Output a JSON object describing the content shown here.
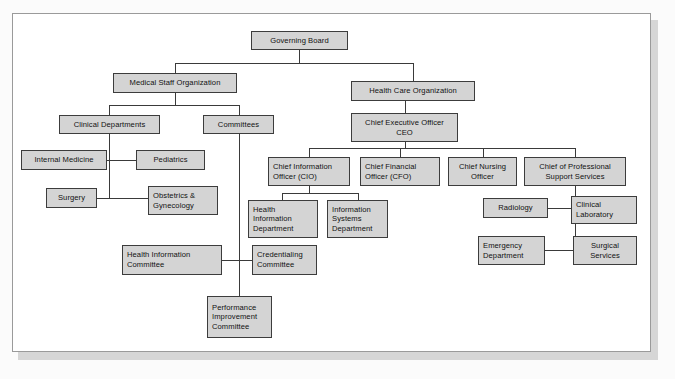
{
  "diagram": {
    "type": "org-chart",
    "colors": {
      "node_fill": "#d4d4d4",
      "node_border": "#3c3c3c",
      "line": "#3a3a3a",
      "panel_background": "#ffffff",
      "panel_border": "#9a9a9a",
      "page_background": "#fbfbfb",
      "shadow": "#d6d6d6"
    },
    "nodes": [
      {
        "id": "governing-board",
        "label": "Governing Board",
        "align": "center"
      },
      {
        "id": "medical-staff-organization",
        "label": "Medical Staff Organization",
        "align": "center"
      },
      {
        "id": "health-care-organization",
        "label": "Health Care Organization",
        "align": "center"
      },
      {
        "id": "clinical-departments",
        "label": "Clinical Departments",
        "align": "center"
      },
      {
        "id": "committees",
        "label": "Committees",
        "align": "center"
      },
      {
        "id": "chief-executive-officer",
        "label": "Chief Executive Officer\nCEO",
        "align": "center"
      },
      {
        "id": "internal-medicine",
        "label": "Internal Medicine",
        "align": "center"
      },
      {
        "id": "pediatrics",
        "label": "Pediatrics",
        "align": "center"
      },
      {
        "id": "surgery",
        "label": "Surgery",
        "align": "center"
      },
      {
        "id": "obstetrics-gynecology",
        "label": "Obstetrics &\nGynecology",
        "align": "left"
      },
      {
        "id": "chief-information-officer",
        "label": "Chief Information\nOfficer (CIO)",
        "align": "left"
      },
      {
        "id": "chief-financial-officer",
        "label": "Chief Financial\nOfficer (CFO)",
        "align": "left"
      },
      {
        "id": "chief-nursing-officer",
        "label": "Chief Nursing\nOfficer",
        "align": "center"
      },
      {
        "id": "chief-of-professional-support-services",
        "label": "Chief of Professional\nSupport Services",
        "align": "center"
      },
      {
        "id": "health-information-department",
        "label": "Health\nInformation\nDepartment",
        "align": "left"
      },
      {
        "id": "information-systems-department",
        "label": "Information\nSystems\nDepartment",
        "align": "left"
      },
      {
        "id": "radiology",
        "label": "Radiology",
        "align": "center"
      },
      {
        "id": "clinical-laboratory",
        "label": "Clinical\nLaboratory",
        "align": "left"
      },
      {
        "id": "emergency-department",
        "label": "Emergency\nDepartment",
        "align": "left"
      },
      {
        "id": "surgical-services",
        "label": "Surgical\nServices",
        "align": "center"
      },
      {
        "id": "health-information-committee",
        "label": "Health Information\nCommittee",
        "align": "left"
      },
      {
        "id": "credentialing-committee",
        "label": "Credentialing\nCommittee",
        "align": "left"
      },
      {
        "id": "performance-improvement-committee",
        "label": "Performance\nImprovement\nCommittee",
        "align": "left"
      }
    ],
    "edges": [
      {
        "from": "governing-board",
        "to": "medical-staff-organization"
      },
      {
        "from": "governing-board",
        "to": "health-care-organization"
      },
      {
        "from": "medical-staff-organization",
        "to": "clinical-departments"
      },
      {
        "from": "medical-staff-organization",
        "to": "committees"
      },
      {
        "from": "clinical-departments",
        "to": "internal-medicine"
      },
      {
        "from": "clinical-departments",
        "to": "pediatrics"
      },
      {
        "from": "clinical-departments",
        "to": "surgery"
      },
      {
        "from": "clinical-departments",
        "to": "obstetrics-gynecology"
      },
      {
        "from": "committees",
        "to": "health-information-committee"
      },
      {
        "from": "committees",
        "to": "credentialing-committee"
      },
      {
        "from": "committees",
        "to": "performance-improvement-committee"
      },
      {
        "from": "health-care-organization",
        "to": "chief-executive-officer"
      },
      {
        "from": "chief-executive-officer",
        "to": "chief-information-officer"
      },
      {
        "from": "chief-executive-officer",
        "to": "chief-financial-officer"
      },
      {
        "from": "chief-executive-officer",
        "to": "chief-nursing-officer"
      },
      {
        "from": "chief-executive-officer",
        "to": "chief-of-professional-support-services"
      },
      {
        "from": "chief-information-officer",
        "to": "health-information-department"
      },
      {
        "from": "chief-information-officer",
        "to": "information-systems-department"
      },
      {
        "from": "chief-of-professional-support-services",
        "to": "radiology"
      },
      {
        "from": "chief-of-professional-support-services",
        "to": "clinical-laboratory"
      },
      {
        "from": "chief-of-professional-support-services",
        "to": "emergency-department"
      },
      {
        "from": "chief-of-professional-support-services",
        "to": "surgical-services"
      }
    ]
  }
}
